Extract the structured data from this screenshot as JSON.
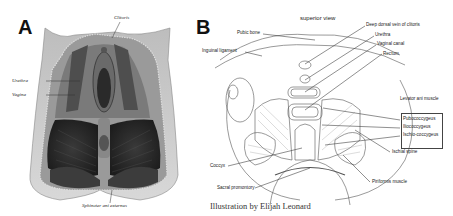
{
  "figure": {
    "panel_a": {
      "letter": "A",
      "labels": {
        "clitoris": "Clitoris",
        "urethra": "Urethra",
        "vagina": "Vagina",
        "sphincter": "Sphincter ani externus"
      }
    },
    "panel_b": {
      "letter": "B",
      "title": "superior view",
      "labels": {
        "pubic_bone": "Pubic bone",
        "inguinal_ligament": "Inguinal ligament",
        "deep_dorsal_vein": "Deep dorsal vein of clitoris",
        "urethra": "Urethra",
        "vaginal_canal": "Vaginal canal",
        "rectum": "Rectum",
        "levator_ani": "Levator ani muscle",
        "pubococcygeus": "Pubococcygeus",
        "iliococcygeus": "Iliococcygeus",
        "ischiococcygeus": "Ischio-coccygeus",
        "ischial_spine": "Ischial spine",
        "piriformis": "Piriformis muscle",
        "coccyx": "Coccyx",
        "sacral_promontory": "Sacral promontory"
      },
      "caption": "Illustration by Elijah Leonard"
    }
  }
}
